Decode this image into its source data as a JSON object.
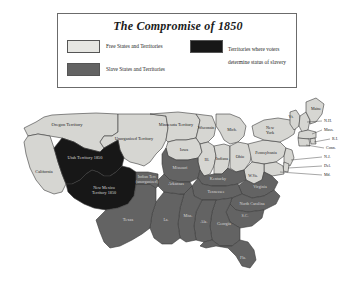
{
  "legend": {
    "title": "The Compromise of 1850",
    "entries": [
      {
        "id": "free",
        "label": "Free States and Territories",
        "color": "#e6e6e2",
        "lines": [
          "Free States and Territories"
        ]
      },
      {
        "id": "popsov",
        "label": "Territories where voters determine status of slavery",
        "color": "#171717",
        "lines": [
          "Territories where voters",
          "determine status of slavery"
        ]
      },
      {
        "id": "slave",
        "label": "Slave States and Territories",
        "color": "#636363",
        "lines": [
          "Slave States and Territories"
        ]
      }
    ]
  },
  "colors": {
    "free": "#d6d6d2",
    "slave": "#636363",
    "popular_sovereignty": "#171717",
    "water": "#ffffff",
    "border": "#3a3a3a",
    "frame": "#6b6b6b"
  },
  "map": {
    "regions": [
      {
        "name": "Oregon Territory",
        "status": "free",
        "label": "Oregon Territory"
      },
      {
        "name": "Utah Territory 1850",
        "status": "popular_sovereignty",
        "label": "Utah Territory 1850"
      },
      {
        "name": "New Mexico Territory 1850",
        "status": "popular_sovereignty",
        "label": "New Mexico\nTerritory 1850"
      },
      {
        "name": "California",
        "status": "free",
        "label": "California"
      },
      {
        "name": "Unorganized Territory",
        "status": "free",
        "label": "Unorganized Territory"
      },
      {
        "name": "Minnesota Territory",
        "status": "free",
        "label": "Minnesota Territory"
      },
      {
        "name": "Indian Terr. (unorganized)",
        "status": "slave",
        "label": "Indian Terr.\n(unorganized)"
      },
      {
        "name": "Texas",
        "status": "slave",
        "label": "Texas"
      },
      {
        "name": "Iowa",
        "status": "free",
        "label": "Iowa"
      },
      {
        "name": "Wisconsin",
        "status": "free",
        "label": "Wisconsin"
      },
      {
        "name": "Michigan",
        "status": "free",
        "label": "Mich."
      },
      {
        "name": "Illinois",
        "status": "free",
        "label": "Ill."
      },
      {
        "name": "Indiana",
        "status": "free",
        "label": "Indiana"
      },
      {
        "name": "Ohio",
        "status": "free",
        "label": "Ohio"
      },
      {
        "name": "Missouri",
        "status": "slave",
        "label": "Missouri"
      },
      {
        "name": "Arkansas",
        "status": "slave",
        "label": "Arkansas"
      },
      {
        "name": "Louisiana",
        "status": "slave",
        "label": "La."
      },
      {
        "name": "Mississippi",
        "status": "slave",
        "label": "Miss."
      },
      {
        "name": "Alabama",
        "status": "slave",
        "label": "Ala."
      },
      {
        "name": "Georgia",
        "status": "slave",
        "label": "Georgia"
      },
      {
        "name": "Florida",
        "status": "slave",
        "label": "Fla."
      },
      {
        "name": "South Carolina",
        "status": "slave",
        "label": "S.C."
      },
      {
        "name": "North Carolina",
        "status": "slave",
        "label": "North Carolina"
      },
      {
        "name": "Tennessee",
        "status": "slave",
        "label": "Tennessee"
      },
      {
        "name": "Kentucky",
        "status": "slave",
        "label": "Kentucky"
      },
      {
        "name": "Virginia",
        "status": "slave",
        "label": "Virginia"
      },
      {
        "name": "West Virginia",
        "status": "free",
        "label": "W.Va."
      },
      {
        "name": "Pennsylvania",
        "status": "free",
        "label": "Pennsylvania"
      },
      {
        "name": "New York",
        "status": "free",
        "label": "New\nYork"
      },
      {
        "name": "Vermont",
        "status": "free",
        "label": "Vt."
      },
      {
        "name": "Maine",
        "status": "free",
        "label": "Maine"
      },
      {
        "name": "New Hampshire",
        "status": "free",
        "label": "N.H."
      },
      {
        "name": "Massachusetts",
        "status": "free",
        "label": "Mass."
      },
      {
        "name": "Rhode Island",
        "status": "free",
        "label": "R.I."
      },
      {
        "name": "Connecticut",
        "status": "free",
        "label": "Conn."
      },
      {
        "name": "New Jersey",
        "status": "free",
        "label": "N.J."
      },
      {
        "name": "Delaware",
        "status": "free",
        "label": "Del."
      },
      {
        "name": "Maryland",
        "status": "free",
        "label": "Md."
      }
    ],
    "callout_labels": [
      "N.H.",
      "Mass.",
      "R.I.",
      "Conn.",
      "N.J.",
      "Del.",
      "Md."
    ]
  }
}
